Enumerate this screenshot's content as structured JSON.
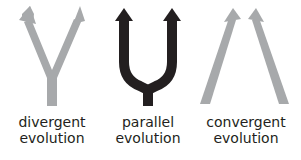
{
  "diagram": {
    "colors": {
      "gray": "#a7a9ab",
      "black": "#231f20",
      "text": "#231f20"
    },
    "panels": [
      {
        "id": "divergent",
        "line1": "divergent",
        "line2": "evolution",
        "color": "gray"
      },
      {
        "id": "parallel",
        "line1": "parallel",
        "line2": "evolution",
        "color": "black"
      },
      {
        "id": "convergent",
        "line1": "convergent",
        "line2": "evolution",
        "color": "gray"
      }
    ]
  }
}
